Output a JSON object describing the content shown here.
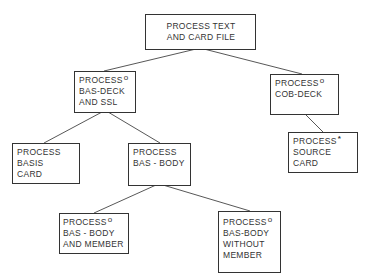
{
  "diagram": {
    "type": "structure-chart",
    "nodes": [
      {
        "id": "n0",
        "lines": [
          "PROCESS TEXT",
          "AND CARD FILE"
        ],
        "marker": ""
      },
      {
        "id": "n1",
        "lines": [
          "PROCESS",
          "BAS-DECK",
          "AND SSL"
        ],
        "marker": "o"
      },
      {
        "id": "n2",
        "lines": [
          "PROCESS",
          "COB-DECK"
        ],
        "marker": "o"
      },
      {
        "id": "n3",
        "lines": [
          "PROCESS",
          "BASIS",
          "CARD"
        ],
        "marker": ""
      },
      {
        "id": "n4",
        "lines": [
          "PROCESS",
          "BAS - BODY"
        ],
        "marker": ""
      },
      {
        "id": "n5",
        "lines": [
          "PROCESS",
          "SOURCE",
          "CARD"
        ],
        "marker": "*"
      },
      {
        "id": "n6",
        "lines": [
          "PROCESS",
          "BAS - BODY",
          "AND MEMBER"
        ],
        "marker": "o"
      },
      {
        "id": "n7",
        "lines": [
          "PROCESS",
          "BAS-BODY",
          "WITHOUT",
          "MEMBER"
        ],
        "marker": "o"
      }
    ],
    "edges": [
      {
        "from": "n0",
        "to": "n1"
      },
      {
        "from": "n0",
        "to": "n2"
      },
      {
        "from": "n1",
        "to": "n3"
      },
      {
        "from": "n1",
        "to": "n4"
      },
      {
        "from": "n2",
        "to": "n5"
      },
      {
        "from": "n4",
        "to": "n6"
      },
      {
        "from": "n4",
        "to": "n7"
      }
    ]
  }
}
